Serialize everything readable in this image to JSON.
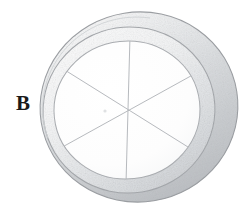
{
  "figure": {
    "kind": "technical-line-drawing",
    "background_color": "#ffffff",
    "canvas": {
      "width": 249,
      "height": 212
    },
    "label": {
      "text": "B",
      "color": "#1a1a1a",
      "x": 16,
      "y": 92
    },
    "stroke_colors": {
      "outline": "#8f9296",
      "outline_light": "#b9bcbf",
      "inner_circle": "#a9acb0",
      "divider_line": "#b2b5b9",
      "shade_dark": "#b4b7bb",
      "shade_mid": "#cfd2d5",
      "shade_light": "#e8eaec",
      "highlight": "#f7f8f9"
    },
    "outer_ring": {
      "cx": 139,
      "cy": 107,
      "rx": 99,
      "ry": 95,
      "rotation_deg": -9
    },
    "inner_ring": {
      "cx": 129,
      "cy": 110,
      "rx": 86,
      "ry": 83,
      "rotation_deg": -9
    },
    "inner_disc": {
      "cx": 127,
      "cy": 110,
      "rx": 73,
      "ry": 69,
      "rotation_deg": -6
    },
    "divider_count": 3,
    "sector_count": 6,
    "divider_angles_deg": [
      90,
      32,
      148
    ]
  }
}
